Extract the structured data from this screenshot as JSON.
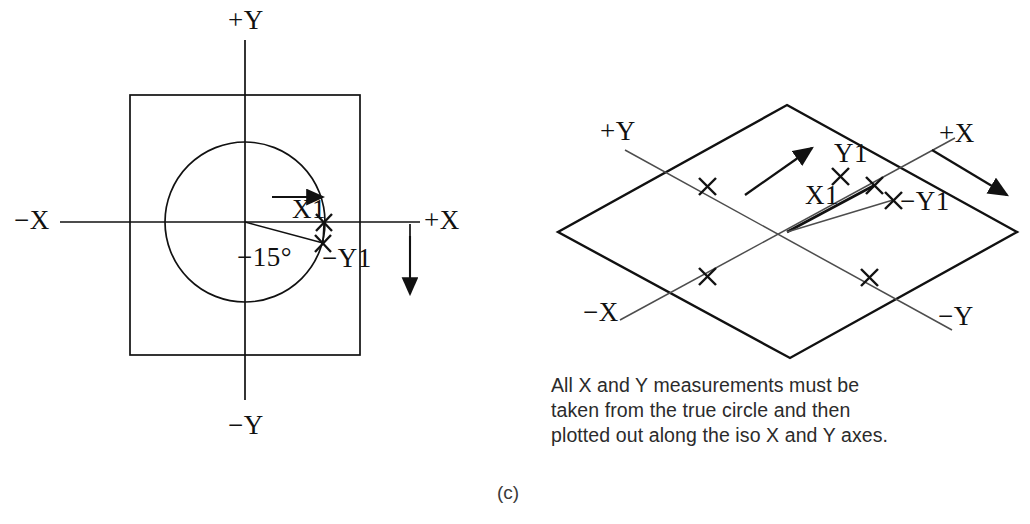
{
  "figure": {
    "subfigure_label": "(c)",
    "caption": "All X and Y measurements must be\ntaken from the true circle and then\nplotted out along the iso X and Y axes.",
    "line_color": "#111111",
    "background_color": "#ffffff"
  },
  "left_diagram": {
    "name": "true-circle-orthographic-view",
    "axis_labels": {
      "plus_y": "+Y",
      "minus_y": "−Y",
      "plus_x": "+X",
      "minus_x": "−X"
    },
    "annotations": {
      "x1": "X1",
      "minus_y1": "−Y1",
      "angle": "−15°"
    },
    "geometry": {
      "square": {
        "left": 130,
        "top": 95,
        "right": 360,
        "bottom": 355
      },
      "circle": {
        "cx": 245,
        "cy": 222,
        "r": 80
      },
      "origin": {
        "x": 245,
        "y": 222
      },
      "angle_degrees": -15,
      "point_x1": {
        "x": 325,
        "y": 222
      },
      "point_minus_y1": {
        "x": 322,
        "y": 243
      }
    }
  },
  "right_diagram": {
    "name": "isometric-plane-view",
    "axis_labels": {
      "plus_y": "+Y",
      "minus_y": "−Y",
      "plus_x": "+X",
      "minus_x": "−X"
    },
    "annotations": {
      "y1": "Y1",
      "x1": "X1",
      "minus_y1": "−Y1"
    },
    "geometry": {
      "parallelogram": {
        "top": {
          "x": 787,
          "y": 105
        },
        "right": {
          "x": 1017,
          "y": 232
        },
        "bottom": {
          "x": 790,
          "y": 358
        },
        "left": {
          "x": 558,
          "y": 232
        }
      },
      "origin": {
        "x": 787,
        "y": 232
      },
      "tick_marks": [
        {
          "x": 707,
          "y": 186,
          "axis": "plus-y"
        },
        {
          "x": 869,
          "y": 187,
          "axis": "y1-upper"
        },
        {
          "x": 707,
          "y": 277,
          "axis": "minus-x"
        },
        {
          "x": 869,
          "y": 278,
          "axis": "minus-y"
        }
      ],
      "point_y1": {
        "x": 869,
        "y": 187
      },
      "point_x1": {
        "x": 869,
        "y": 187
      },
      "point_minus_y1": {
        "x": 890,
        "y": 200
      }
    }
  }
}
